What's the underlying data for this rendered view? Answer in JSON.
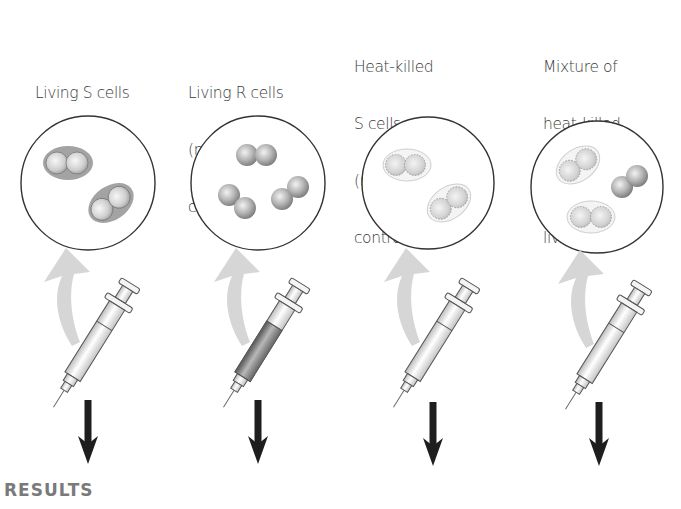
{
  "figure": {
    "section_label": "RESULTS",
    "colors": {
      "circle_stroke": "#333333",
      "cell_fill_living": "#b8b8b8",
      "capsule_fill": "#9a9a9a",
      "arrow_curved": "#d4d4d4",
      "arrow_down": "#1e1e1e",
      "results_text": "#7a7a7a",
      "syringe_liquid_R": "#8a8a8a"
    },
    "columns": [
      {
        "id": "living-s",
        "label_lines": [
          "Living S cells",
          "(pathogenic",
          "control)"
        ],
        "cells": "encapsulated living S cells (2 capsule pairs)",
        "syringe_liquid": "clear"
      },
      {
        "id": "living-r",
        "label_lines": [
          "Living R cells",
          "(nonpathogenic",
          "control)"
        ],
        "cells": "living R cells without capsule (3 pairs)",
        "syringe_liquid": "dark"
      },
      {
        "id": "heat-killed-s",
        "label_lines": [
          "Heat-killed",
          "S cells",
          "(nonpathogenic",
          "control)"
        ],
        "cells": "heat-killed S cells, dotted outline (2 capsule pairs)",
        "syringe_liquid": "clear"
      },
      {
        "id": "mixture",
        "label_lines": [
          "Mixture of",
          "heat-killed",
          "S cells and",
          "living R cells"
        ],
        "cells": "2 heat-killed S pairs + 1 living R pair",
        "syringe_liquid": "clear"
      }
    ]
  }
}
